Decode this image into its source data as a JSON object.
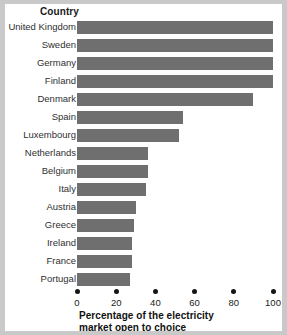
{
  "chart_data": {
    "type": "bar",
    "orientation": "horizontal",
    "title": "",
    "category_header": "Country",
    "xlabel": "Percentage of the electricity market open to choice",
    "ylabel": "Country",
    "xlim": [
      0,
      100
    ],
    "xticks": [
      0,
      20,
      40,
      60,
      80,
      100
    ],
    "xtick_labels": [
      "0",
      "20",
      "40",
      "60",
      "80",
      "100"
    ],
    "grid": false,
    "legend": "none",
    "bar_color": "#6f6f6f",
    "background_color": "#ffffff",
    "frame_color": "#c9c9c9",
    "categories": [
      "United Kingdom",
      "Sweden",
      "Germany",
      "Finland",
      "Denmark",
      "Spain",
      "Luxembourg",
      "Netherlands",
      "Belgium",
      "Italy",
      "Austria",
      "Greece",
      "Ireland",
      "France",
      "Portugal"
    ],
    "values": [
      100,
      100,
      100,
      100,
      90,
      54,
      52,
      36,
      36,
      35,
      30,
      29,
      28,
      28,
      27
    ],
    "series": [
      {
        "name": "Percentage of the electricity market open to choice",
        "values": [
          100,
          100,
          100,
          100,
          90,
          54,
          52,
          36,
          36,
          35,
          30,
          29,
          28,
          28,
          27
        ]
      }
    ]
  },
  "caption": {
    "line1": "Percentage of the electricity",
    "line2": "market open to choice"
  }
}
